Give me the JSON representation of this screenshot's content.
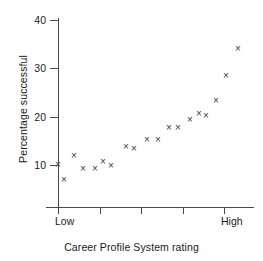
{
  "chart_data": {
    "type": "scatter",
    "title": "",
    "subtitle": "",
    "xlabel": "Career Profile System rating",
    "ylabel": "Percentage successful",
    "xtick_labels": [
      "Low",
      "",
      "",
      "",
      "High"
    ],
    "xtick_positions": [
      0,
      1,
      2,
      3,
      4
    ],
    "ytick_labels": [
      "10",
      "20",
      "30",
      "40"
    ],
    "ytick_values": [
      10,
      20,
      30,
      40
    ],
    "ylim": [
      3,
      42
    ],
    "xlim": [
      -0.12,
      4.22
    ],
    "grid": false,
    "legend": null,
    "marker": "x",
    "marker_color": "#3a3a3a",
    "series": [
      {
        "name": "observations",
        "x": [
          0.0,
          0.15,
          0.4,
          0.58,
          0.9,
          1.08,
          1.26,
          1.6,
          1.8,
          2.0,
          2.2,
          2.42,
          2.62,
          2.8,
          2.98,
          3.18,
          3.38,
          3.56,
          3.78,
          4.0
        ],
        "y": [
          10.1,
          7.3,
          12.0,
          9.3,
          9.3,
          11.1,
          10.3,
          14.1,
          13.7,
          15.6,
          15.6,
          18.0,
          18.1,
          19.6,
          20.9,
          20.5,
          23.7,
          28.9,
          34.4,
          34.4
        ]
      }
    ],
    "points": [
      {
        "x": 58,
        "y": 164,
        "value_y": 10.1
      },
      {
        "x": 64,
        "y": 179,
        "value_y": 7.3
      },
      {
        "x": 74,
        "y": 155,
        "value_y": 12.0
      },
      {
        "x": 83,
        "y": 168,
        "value_y": 9.3
      },
      {
        "x": 95,
        "y": 168,
        "value_y": 9.3
      },
      {
        "x": 103,
        "y": 161,
        "value_y": 11.1
      },
      {
        "x": 111,
        "y": 165,
        "value_y": 10.3
      },
      {
        "x": 126,
        "y": 146,
        "value_y": 14.1
      },
      {
        "x": 134,
        "y": 148,
        "value_y": 13.7
      },
      {
        "x": 147,
        "y": 139,
        "value_y": 15.6
      },
      {
        "x": 158,
        "y": 139,
        "value_y": 15.6
      },
      {
        "x": 169,
        "y": 127,
        "value_y": 18.0
      },
      {
        "x": 178,
        "y": 127,
        "value_y": 18.1
      },
      {
        "x": 190,
        "y": 119,
        "value_y": 19.6
      },
      {
        "x": 199,
        "y": 113,
        "value_y": 20.9
      },
      {
        "x": 206,
        "y": 115,
        "value_y": 20.5
      },
      {
        "x": 216,
        "y": 100,
        "value_y": 23.7
      },
      {
        "x": 226,
        "y": 75,
        "value_y": 28.9
      },
      {
        "x": 238,
        "y": 48,
        "value_y": 34.4
      }
    ]
  },
  "axes": {
    "y": {
      "label": "Percentage successful",
      "ticks": [
        {
          "label": "40",
          "px": 20
        },
        {
          "label": "30",
          "px": 68
        },
        {
          "label": "20",
          "px": 117
        },
        {
          "label": "10",
          "px": 165
        }
      ]
    },
    "x": {
      "label": "Career Profile System rating",
      "ticks": [
        {
          "label": "Low",
          "px": 58
        },
        {
          "label": "",
          "px": 100
        },
        {
          "label": "",
          "px": 141
        },
        {
          "label": "",
          "px": 183
        },
        {
          "label": "High",
          "px": 224
        }
      ]
    }
  }
}
